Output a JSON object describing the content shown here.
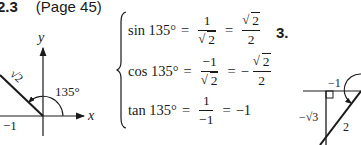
{
  "heading": {
    "section_number": "2.3",
    "page_reference": "(Page 45)"
  },
  "left_diagram": {
    "x_axis_label": "x",
    "y_axis_label": "y",
    "angle_label": "135°",
    "hypotenuse_label": "√2",
    "x_value_label": "−1"
  },
  "equations": [
    {
      "lhs": "sin 135°",
      "eq1": "=",
      "frac1_num": "1",
      "frac1_den": "2",
      "eq2": "=",
      "sign": "",
      "frac2_num": "2",
      "frac2_den": "2"
    },
    {
      "lhs": "cos 135°",
      "eq1": "=",
      "frac1_num": "−1",
      "frac1_den": "2",
      "eq2": "=",
      "sign": "−",
      "frac2_num": "2",
      "frac2_den": "2"
    },
    {
      "lhs": "tan 135°",
      "eq1": "=",
      "frac1_num": "1",
      "frac1_den": "−1",
      "eq2": "=",
      "result": "−1"
    }
  ],
  "right_diagram": {
    "problem_number": "3.",
    "horizontal_label": "−1",
    "vertical_label": "−√3",
    "hypotenuse_label": "2"
  }
}
